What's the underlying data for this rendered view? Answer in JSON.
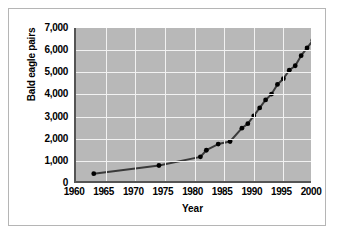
{
  "chart_data": {
    "type": "line",
    "title": "",
    "xlabel": "Year",
    "ylabel": "Bald eagle pairs",
    "xlim": [
      1960,
      2000
    ],
    "ylim": [
      0,
      7000
    ],
    "grid": true,
    "legend": null,
    "x_ticks": [
      "1960",
      "1965",
      "1970",
      "1975",
      "1980",
      "1985",
      "1990",
      "1995",
      "2000"
    ],
    "y_ticks": [
      "0",
      "1,000",
      "2,000",
      "3,000",
      "4,000",
      "5,000",
      "6,000",
      "7,000"
    ],
    "series": [
      {
        "name": "Bald eagle pairs",
        "marker": "circle",
        "color": "#3a3a3a",
        "points": [
          {
            "x": 1963,
            "y": 420
          },
          {
            "x": 1974,
            "y": 790
          },
          {
            "x": 1981,
            "y": 1180
          },
          {
            "x": 1982,
            "y": 1480
          },
          {
            "x": 1984,
            "y": 1760
          },
          {
            "x": 1986,
            "y": 1875
          },
          {
            "x": 1988,
            "y": 2475
          },
          {
            "x": 1989,
            "y": 2680
          },
          {
            "x": 1990,
            "y": 3035
          },
          {
            "x": 1991,
            "y": 3390
          },
          {
            "x": 1992,
            "y": 3750
          },
          {
            "x": 1993,
            "y": 4015
          },
          {
            "x": 1994,
            "y": 4450
          },
          {
            "x": 1995,
            "y": 4710
          },
          {
            "x": 1996,
            "y": 5095
          },
          {
            "x": 1997,
            "y": 5295
          },
          {
            "x": 1998,
            "y": 5750
          },
          {
            "x": 1999,
            "y": 6100
          },
          {
            "x": 2000,
            "y": 6450
          }
        ]
      }
    ]
  },
  "figure": {
    "caption": ""
  },
  "colors": {
    "plot_background": "#b8b8b8",
    "gridline": "#f2f2f2",
    "axis": "#555555",
    "series": "#3a3a3a",
    "frame": "#b5b5b5"
  }
}
